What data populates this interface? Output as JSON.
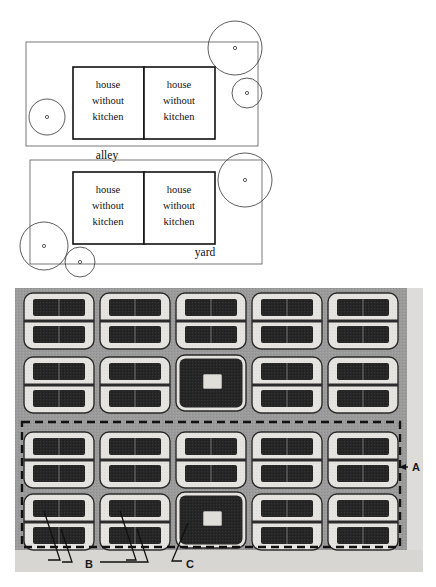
{
  "page": {
    "background": "#ffffff",
    "width": 436,
    "height": 587
  },
  "figure_top": {
    "name": "courtyard-house-plan-diagram",
    "description": "Two stacked line-drawn site plans, each with a pair of adjoining rectangles labelled 'house without kitchen', surrounded by circles with small dots at their centres.",
    "stroke_color": "#222222",
    "plans": [
      {
        "id": "plan-upper",
        "open_space_label": "alley",
        "units": [
          {
            "id": "upper-left-unit",
            "line1": "house",
            "line2": "without",
            "line3": "kitchen"
          },
          {
            "id": "upper-right-unit",
            "line1": "house",
            "line2": "without",
            "line3": "kitchen"
          }
        ],
        "trees": [
          {
            "id": "tree-upper-left",
            "cx": 47,
            "cy": 117,
            "r": 18
          },
          {
            "id": "tree-upper-right-large",
            "cx": 235,
            "cy": 48,
            "r": 27
          },
          {
            "id": "tree-upper-right-small",
            "cx": 247,
            "cy": 93,
            "r": 15
          }
        ]
      },
      {
        "id": "plan-lower",
        "open_space_label": "yard",
        "units": [
          {
            "id": "lower-left-unit",
            "line1": "house",
            "line2": "without",
            "line3": "kitchen"
          },
          {
            "id": "lower-right-unit",
            "line1": "house",
            "line2": "without",
            "line3": "kitchen"
          }
        ],
        "trees": [
          {
            "id": "tree-lower-right",
            "cx": 245,
            "cy": 180,
            "r": 27
          },
          {
            "id": "tree-lower-left-large",
            "cx": 44,
            "cy": 246,
            "r": 24
          },
          {
            "id": "tree-lower-left-small",
            "cx": 80,
            "cy": 262,
            "r": 15
          }
        ]
      }
    ]
  },
  "figure_bottom": {
    "name": "housing-block-aerial-model",
    "description": "Grayscale aerial-style model photo showing a 5 by 4 grid of housing blocks; a dashed rectangle encloses the lower two rows; leader lines point to callouts A, B and C.",
    "grid": {
      "columns": 5,
      "rows": 4,
      "cells": [
        [
          "double-bar",
          "double-bar",
          "double-bar",
          "double-bar",
          "double-bar"
        ],
        [
          "double-bar",
          "double-bar",
          "solid-courtyard",
          "double-bar",
          "double-bar"
        ],
        [
          "double-bar",
          "double-bar",
          "double-bar",
          "double-bar",
          "double-bar"
        ],
        [
          "double-bar",
          "double-bar",
          "solid-courtyard",
          "double-bar",
          "double-bar"
        ]
      ]
    },
    "colors": {
      "photo_background": "#9b9b9b",
      "block_light": "#e6e4e0",
      "block_dark": "#262626",
      "margin_band": "#d8d6d2",
      "dashed_outline": "#111111"
    },
    "callouts": [
      {
        "id": "callout-a",
        "label": "A",
        "x": 412,
        "y": 468,
        "note": "arrow pointing left at dashed boundary"
      },
      {
        "id": "callout-b",
        "label": "B",
        "x": 90,
        "y": 569,
        "note": "leader lines to two blocks in bottom-left"
      },
      {
        "id": "callout-c",
        "label": "C",
        "x": 190,
        "y": 569,
        "note": "leader line to solid courtyard block"
      }
    ]
  }
}
